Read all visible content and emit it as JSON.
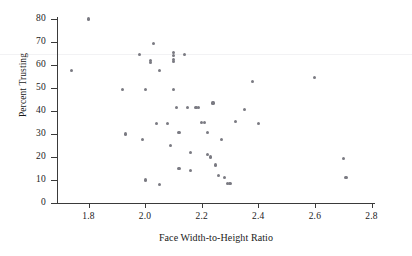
{
  "chart_data": {
    "type": "scatter",
    "title": "",
    "xlabel": "Face Width-to-Height Ratio",
    "ylabel": "Percent Trusting",
    "xlim": [
      1.7,
      2.83
    ],
    "ylim": [
      0,
      84
    ],
    "xticks": [
      1.8,
      2.0,
      2.2,
      2.4,
      2.6,
      2.8
    ],
    "xtick_labels": [
      "1.8",
      "2.0",
      "2.2",
      "2.4",
      "2.6",
      "2.8"
    ],
    "yticks": [
      0,
      10,
      20,
      30,
      40,
      50,
      60,
      70,
      80
    ],
    "ytick_labels": [
      "0",
      "10",
      "20",
      "30",
      "40",
      "50",
      "60",
      "70",
      "80"
    ],
    "grid": false,
    "legend": null,
    "marker_color": "#7a7a82",
    "axis_color": "#3a3a3a",
    "reference_line": {
      "y": 65,
      "color": "#f2f2f4",
      "orientation": "horizontal"
    },
    "points": [
      {
        "x": 1.74,
        "y": 57.5
      },
      {
        "x": 1.8,
        "y": 80.0
      },
      {
        "x": 1.92,
        "y": 49.5
      },
      {
        "x": 1.93,
        "y": 30.0
      },
      {
        "x": 1.98,
        "y": 64.5
      },
      {
        "x": 1.99,
        "y": 27.5
      },
      {
        "x": 2.0,
        "y": 49.5
      },
      {
        "x": 2.0,
        "y": 10.0
      },
      {
        "x": 2.03,
        "y": 69.5
      },
      {
        "x": 2.02,
        "y": 62.0
      },
      {
        "x": 2.02,
        "y": 61.0
      },
      {
        "x": 2.04,
        "y": 34.5
      },
      {
        "x": 2.05,
        "y": 57.5
      },
      {
        "x": 2.05,
        "y": 8.0
      },
      {
        "x": 2.08,
        "y": 34.5
      },
      {
        "x": 2.09,
        "y": 25.0
      },
      {
        "x": 2.1,
        "y": 65.5
      },
      {
        "x": 2.1,
        "y": 64.0
      },
      {
        "x": 2.1,
        "y": 62.5
      },
      {
        "x": 2.1,
        "y": 61.5
      },
      {
        "x": 2.1,
        "y": 49.5
      },
      {
        "x": 2.11,
        "y": 41.5
      },
      {
        "x": 2.12,
        "y": 30.5
      },
      {
        "x": 2.12,
        "y": 15.0
      },
      {
        "x": 2.14,
        "y": 64.5
      },
      {
        "x": 2.15,
        "y": 41.5
      },
      {
        "x": 2.16,
        "y": 22.0
      },
      {
        "x": 2.16,
        "y": 14.0
      },
      {
        "x": 2.18,
        "y": 41.5
      },
      {
        "x": 2.19,
        "y": 41.5
      },
      {
        "x": 2.2,
        "y": 35.0
      },
      {
        "x": 2.21,
        "y": 35.0
      },
      {
        "x": 2.22,
        "y": 30.5
      },
      {
        "x": 2.22,
        "y": 21.0
      },
      {
        "x": 2.23,
        "y": 20.0
      },
      {
        "x": 2.24,
        "y": 43.5
      },
      {
        "x": 2.25,
        "y": 16.5
      },
      {
        "x": 2.26,
        "y": 12.0
      },
      {
        "x": 2.27,
        "y": 27.5
      },
      {
        "x": 2.28,
        "y": 11.0
      },
      {
        "x": 2.29,
        "y": 8.5
      },
      {
        "x": 2.3,
        "y": 8.5
      },
      {
        "x": 2.32,
        "y": 35.5
      },
      {
        "x": 2.35,
        "y": 40.5
      },
      {
        "x": 2.38,
        "y": 53.0
      },
      {
        "x": 2.4,
        "y": 34.5
      },
      {
        "x": 2.6,
        "y": 54.5
      },
      {
        "x": 2.7,
        "y": 19.5
      },
      {
        "x": 2.71,
        "y": 11.0
      }
    ]
  }
}
